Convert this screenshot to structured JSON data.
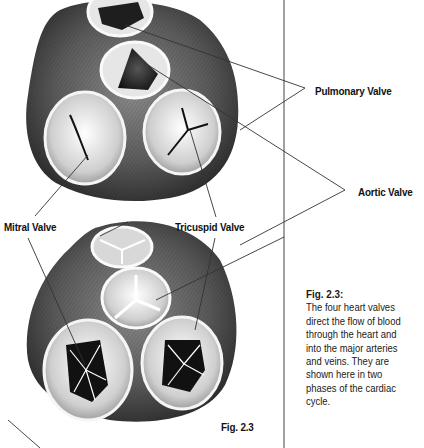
{
  "figure": {
    "number_label": "Fig. 2.3",
    "caption_title": "Fig. 2.3:",
    "caption_lines": [
      "The four heart valves",
      "direct the flow of blood",
      "through the heart and",
      "into the major arteries",
      "and veins. They are",
      "shown here in two",
      "phases of the cardiac",
      "cycle."
    ]
  },
  "labels": {
    "pulmonary": "Pulmonary Valve",
    "aortic": "Aortic Valve",
    "mitral": "Mitral Valve",
    "tricuspid": "Tricuspid Valve"
  },
  "colors": {
    "heart_dark": "#3a3a3a",
    "heart_mid": "#6b6b6b",
    "valve_light": "#d9d9d9",
    "valve_rim": "#efefef",
    "line": "#333333"
  }
}
